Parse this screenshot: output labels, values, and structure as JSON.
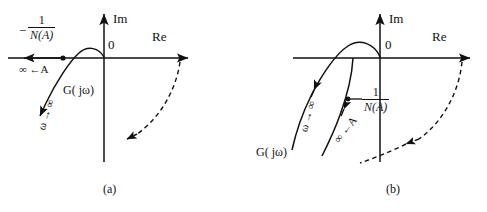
{
  "figure": {
    "type": "nyquist-describing-function-diagrams",
    "panels": [
      {
        "id": "a",
        "caption": "(a)",
        "axes": {
          "imag_label": "Im",
          "real_label": "Re",
          "origin_label": "0"
        },
        "labels": {
          "neg_inv_n_minus": "−",
          "neg_inv_n_num": "1",
          "neg_inv_n_den": "N(A)",
          "a_to_infinity": "∞ ←A",
          "g_jw": "G( jω)",
          "omega_to_infinity": "ω → ∞"
        }
      },
      {
        "id": "b",
        "caption": "(b)",
        "axes": {
          "imag_label": "Im",
          "real_label": "Re",
          "origin_label": "0"
        },
        "labels": {
          "neg_inv_n_num": "1",
          "neg_inv_n_den": "N(A)",
          "a_to_infinity": "∞ ←A",
          "g_jw": "G( jω)",
          "omega_to_infinity": "ω → ∞"
        }
      }
    ],
    "colors": {
      "stroke": "#111111",
      "background": "#ffffff"
    }
  }
}
